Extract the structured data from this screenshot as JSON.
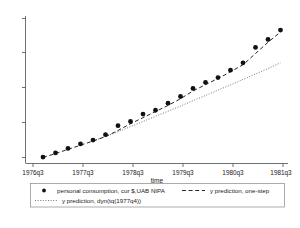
{
  "chart_data": {
    "type": "scatter",
    "title": "",
    "subtitle": "",
    "xlabel": "time",
    "ylabel": "",
    "grid": false,
    "legend_position": "bottom",
    "x_tick_labels": [
      "1976q3",
      "1977q3",
      "1978q3",
      "1979q3",
      "1980q3",
      "1981q3"
    ],
    "x_tick_values": [
      1976.5,
      1977.5,
      1978.5,
      1979.5,
      1980.5,
      1981.5
    ],
    "y_tick_labels": [
      "",
      "",
      "",
      "",
      ""
    ],
    "y_tick_values": [
      1000,
      1200,
      1400,
      1600,
      1800
    ],
    "xlim": [
      1976.4,
      1981.65
    ],
    "ylim": [
      960,
      1880
    ],
    "series": [
      {
        "name": "personal consumption, cur $,UAB NIPA",
        "style": "markers",
        "x": [
          1976.75,
          1977.0,
          1977.25,
          1977.5,
          1977.75,
          1978.0,
          1978.25,
          1978.5,
          1978.75,
          1979.0,
          1979.25,
          1979.5,
          1979.75,
          1980.0,
          1980.25,
          1980.5,
          1980.75,
          1981.0,
          1981.25,
          1981.5
        ],
        "y": [
          1000,
          1026,
          1054,
          1082,
          1106,
          1140,
          1196,
          1222,
          1268,
          1292,
          1336,
          1378,
          1428,
          1466,
          1496,
          1542,
          1588,
          1684,
          1734,
          1792
        ]
      },
      {
        "name": "y prediction, one-step",
        "style": "dashed-line",
        "x": [
          1976.75,
          1977.0,
          1977.25,
          1977.5,
          1977.75,
          1978.0,
          1978.25,
          1978.5,
          1978.75,
          1979.0,
          1979.25,
          1979.5,
          1979.75,
          1980.0,
          1980.25,
          1980.5,
          1980.75,
          1981.0,
          1981.25,
          1981.5
        ],
        "y": [
          998,
          1022,
          1048,
          1074,
          1100,
          1128,
          1166,
          1208,
          1246,
          1284,
          1322,
          1364,
          1412,
          1452,
          1490,
          1532,
          1576,
          1646,
          1716,
          1780
        ]
      },
      {
        "name": "y prediction, dyn(tq(1977q4))",
        "style": "dotted-line",
        "x": [
          1977.75,
          1978.0,
          1978.25,
          1978.5,
          1978.75,
          1979.0,
          1979.25,
          1979.5,
          1979.75,
          1980.0,
          1980.25,
          1980.5,
          1980.75,
          1981.0,
          1981.25,
          1981.5
        ],
        "y": [
          1100,
          1128,
          1158,
          1190,
          1222,
          1254,
          1286,
          1318,
          1352,
          1384,
          1418,
          1450,
          1484,
          1518,
          1552,
          1588
        ]
      }
    ]
  },
  "axis": {
    "x_title": "time",
    "ticks_x": [
      "1976q3",
      "1977q3",
      "1978q3",
      "1979q3",
      "1980q3",
      "1981q3"
    ]
  },
  "legend": {
    "entry_markers": "personal consumption, cur $,UAB NIPA",
    "entry_onestep": "y prediction, one-step",
    "entry_dynamic": "y prediction, dyn(tq(1977q4))"
  }
}
